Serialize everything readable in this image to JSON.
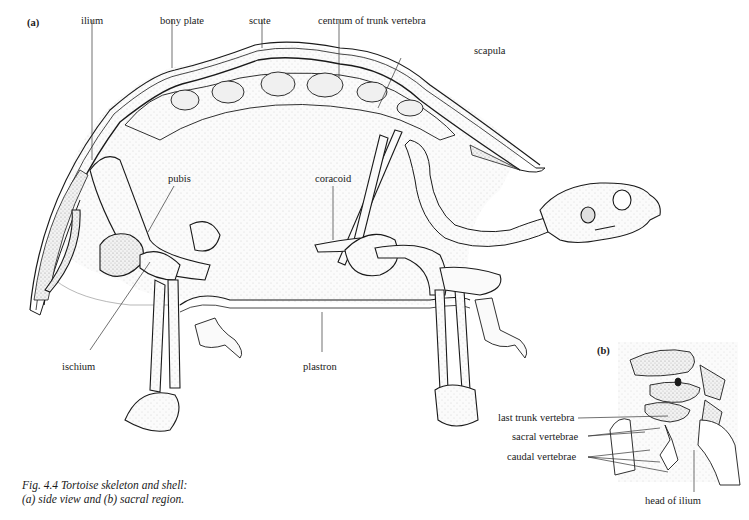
{
  "figure": {
    "panel_a_label": "(a)",
    "panel_b_label": "(b)",
    "caption_line1": "Fig. 4.4 Tortoise skeleton and shell:",
    "caption_line2": "(a) side view and (b) sacral region.",
    "panel_a_labels": {
      "ilium": "ilium",
      "bony_plate": "bony plate",
      "scute": "scute",
      "centrum": "centrum of trunk vertebra",
      "scapula": "scapula",
      "pubis": "pubis",
      "coracoid": "coracoid",
      "ischium": "ischium",
      "plastron": "plastron"
    },
    "panel_b_labels": {
      "last_trunk_vertebra": "last trunk vertebra",
      "sacral_vertebrae": "sacral vertebrae",
      "caudal_vertebrae": "caudal vertebrae",
      "head_of_ilium": "head of ilium"
    },
    "colors": {
      "ink": "#1a1a1a",
      "stipple": "#d9d9d9",
      "paper": "#ffffff"
    }
  }
}
